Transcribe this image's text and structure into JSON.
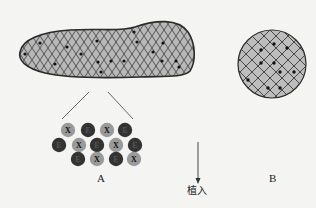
{
  "diagram": {
    "tissue_label_A": "A",
    "graft_label_B": "B",
    "arrow_label": "植入",
    "colors": {
      "background": "#f4f4f2",
      "tissue_fill": "#b8b8b8",
      "hatch": "#3a3a3a",
      "outline": "#2a2a2a",
      "cell_x_fill": "#9a9a9a",
      "cell_e_fill": "#333333",
      "dot": "#111111"
    },
    "cells": [
      {
        "letter": "X",
        "type": "grey",
        "x": 68,
        "y": 130
      },
      {
        "letter": "E",
        "type": "dark",
        "x": 88,
        "y": 130
      },
      {
        "letter": "X",
        "type": "grey",
        "x": 107,
        "y": 130
      },
      {
        "letter": "E",
        "type": "dark",
        "x": 125,
        "y": 130
      },
      {
        "letter": "E",
        "type": "dark",
        "x": 59,
        "y": 145
      },
      {
        "letter": "X",
        "type": "grey",
        "x": 79,
        "y": 145
      },
      {
        "letter": "E",
        "type": "dark",
        "x": 97,
        "y": 145
      },
      {
        "letter": "X",
        "type": "grey",
        "x": 116,
        "y": 145
      },
      {
        "letter": "E",
        "type": "dark",
        "x": 135,
        "y": 145
      },
      {
        "letter": "E",
        "type": "dark",
        "x": 78,
        "y": 159
      },
      {
        "letter": "X",
        "type": "grey",
        "x": 97,
        "y": 159
      },
      {
        "letter": "E",
        "type": "dark",
        "x": 116,
        "y": 159
      },
      {
        "letter": "X",
        "type": "grey",
        "x": 134,
        "y": 159
      }
    ]
  }
}
